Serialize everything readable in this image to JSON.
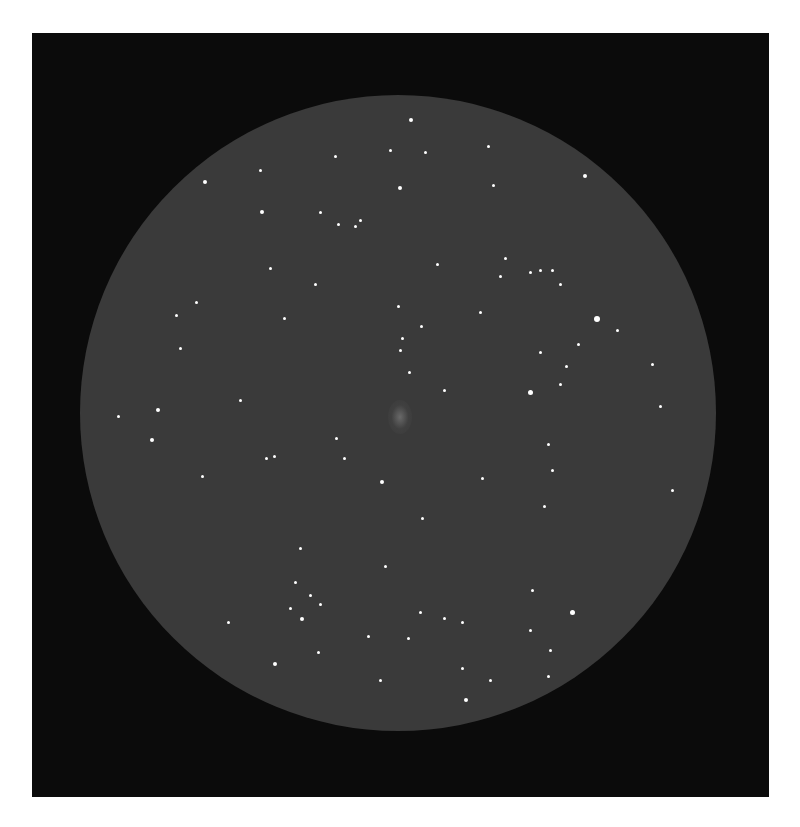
{
  "image": {
    "description": "Pencil-style eyepiece sketch of a star field with a faint galaxy/nebula at center",
    "colors": {
      "background": "#ffffff",
      "frame": "#0b0b0b",
      "field": "#3a3a3a",
      "star": "#ffffff"
    }
  },
  "stars": [
    [
      411,
      120,
      2
    ],
    [
      390,
      150,
      1.5
    ],
    [
      425,
      152,
      1.5
    ],
    [
      488,
      146,
      1.5
    ],
    [
      205,
      182,
      2
    ],
    [
      260,
      170,
      1.5
    ],
    [
      335,
      156,
      1.5
    ],
    [
      400,
      188,
      2
    ],
    [
      493,
      185,
      1.5
    ],
    [
      585,
      176,
      2
    ],
    [
      262,
      212,
      2
    ],
    [
      320,
      212,
      1.5
    ],
    [
      338,
      224,
      1.5
    ],
    [
      355,
      226,
      1.5
    ],
    [
      360,
      220,
      1.5
    ],
    [
      437,
      264,
      1.5
    ],
    [
      505,
      258,
      1.5
    ],
    [
      500,
      276,
      1.5
    ],
    [
      530,
      272,
      1.5
    ],
    [
      540,
      270,
      1.5
    ],
    [
      552,
      270,
      1.5
    ],
    [
      560,
      284,
      1.5
    ],
    [
      315,
      284,
      1.5
    ],
    [
      196,
      302,
      1.5
    ],
    [
      176,
      315,
      1.5
    ],
    [
      284,
      318,
      1.5
    ],
    [
      398,
      306,
      1.5
    ],
    [
      421,
      326,
      1.5
    ],
    [
      480,
      312,
      1.5
    ],
    [
      597,
      319,
      3
    ],
    [
      617,
      330,
      1.5
    ],
    [
      578,
      344,
      1.5
    ],
    [
      180,
      348,
      1.5
    ],
    [
      400,
      350,
      1.5
    ],
    [
      540,
      352,
      1.5
    ],
    [
      566,
      366,
      1.5
    ],
    [
      652,
      364,
      1.5
    ],
    [
      530,
      392,
      2.5
    ],
    [
      560,
      384,
      1.5
    ],
    [
      409,
      372,
      1.5
    ],
    [
      118,
      416,
      1.5
    ],
    [
      158,
      410,
      2
    ],
    [
      152,
      440,
      2
    ],
    [
      240,
      400,
      1.5
    ],
    [
      336,
      438,
      1.5
    ],
    [
      266,
      458,
      1.5
    ],
    [
      274,
      456,
      1.5
    ],
    [
      344,
      458,
      1.5
    ],
    [
      548,
      444,
      1.5
    ],
    [
      660,
      406,
      1.5
    ],
    [
      552,
      470,
      1.5
    ],
    [
      202,
      476,
      1.5
    ],
    [
      382,
      482,
      2
    ],
    [
      482,
      478,
      1.5
    ],
    [
      422,
      518,
      1.5
    ],
    [
      672,
      490,
      1.5
    ],
    [
      544,
      506,
      1.5
    ],
    [
      300,
      548,
      1.5
    ],
    [
      385,
      566,
      1.5
    ],
    [
      295,
      582,
      1.5
    ],
    [
      310,
      595,
      1.5
    ],
    [
      290,
      608,
      1.5
    ],
    [
      302,
      619,
      2
    ],
    [
      228,
      622,
      1.5
    ],
    [
      320,
      604,
      1.5
    ],
    [
      420,
      612,
      1.5
    ],
    [
      444,
      618,
      1.5
    ],
    [
      462,
      622,
      1.5
    ],
    [
      572,
      612,
      2.5
    ],
    [
      532,
      590,
      1.5
    ],
    [
      368,
      636,
      1.5
    ],
    [
      408,
      638,
      1.5
    ],
    [
      530,
      630,
      1.5
    ],
    [
      318,
      652,
      1.5
    ],
    [
      275,
      664,
      2
    ],
    [
      380,
      680,
      1.5
    ],
    [
      462,
      668,
      1.5
    ],
    [
      490,
      680,
      1.5
    ],
    [
      550,
      650,
      1.5
    ],
    [
      548,
      676,
      1.5
    ],
    [
      466,
      700,
      2
    ],
    [
      402,
      338,
      1.5
    ],
    [
      270,
      268,
      1.5
    ],
    [
      444,
      390,
      1.5
    ]
  ],
  "nebula": {
    "x": 400,
    "y": 417,
    "label": "faint diffuse object"
  }
}
